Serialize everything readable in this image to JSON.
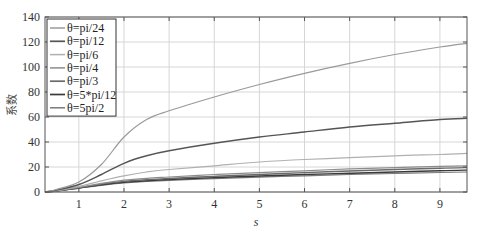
{
  "chart_data": {
    "type": "line",
    "title": "",
    "xlabel": "s",
    "ylabel": "系数",
    "xlim": [
      0.25,
      9.6
    ],
    "ylim": [
      0,
      140
    ],
    "xticks": [
      1,
      2,
      3,
      4,
      5,
      6,
      7,
      8,
      9
    ],
    "yticks": [
      0,
      20,
      40,
      60,
      80,
      100,
      120,
      140
    ],
    "grid": true,
    "legend_position": "upper-left",
    "x": [
      0.25,
      0.5,
      1.0,
      1.5,
      2.0,
      2.5,
      3.0,
      4.0,
      5.0,
      6.0,
      7.0,
      8.0,
      9.0,
      9.6
    ],
    "series": [
      {
        "name": "θ=pi/24",
        "color": "#9a9a9a",
        "width": 1.2,
        "values": [
          0,
          2,
          8,
          22,
          44,
          58,
          65,
          76,
          86,
          95,
          103,
          110,
          116,
          119
        ]
      },
      {
        "name": "θ=pi/12",
        "color": "#555555",
        "width": 1.4,
        "values": [
          0,
          1.5,
          6,
          14,
          23,
          29,
          33,
          39,
          44,
          48,
          52,
          55,
          58,
          59
        ]
      },
      {
        "name": "θ=pi/6",
        "color": "#b0b0b0",
        "width": 1.2,
        "values": [
          0,
          1,
          4.5,
          9,
          13,
          16,
          18,
          21,
          24,
          26,
          27.5,
          29,
          30,
          31
        ]
      },
      {
        "name": "θ=pi/4",
        "color": "#8c8c8c",
        "width": 1.2,
        "values": [
          0,
          1,
          3.8,
          7,
          9.5,
          11,
          12,
          14,
          15.5,
          17,
          18.5,
          19.5,
          20.5,
          21
        ]
      },
      {
        "name": "θ=pi/3",
        "color": "#6a6a6a",
        "width": 1.4,
        "values": [
          0,
          0.9,
          3.5,
          6.3,
          8.5,
          9.8,
          10.8,
          12.5,
          14,
          15.5,
          16.8,
          18,
          19,
          19.5
        ]
      },
      {
        "name": "θ=5*pi/12",
        "color": "#3a3a3a",
        "width": 1.4,
        "values": [
          0,
          0.8,
          3.2,
          5.8,
          7.8,
          9,
          10,
          11.5,
          12.8,
          14,
          15,
          16,
          17,
          17.5
        ]
      },
      {
        "name": "θ=5pi/2",
        "color": "#7a7a7a",
        "width": 1.2,
        "values": [
          0,
          0.8,
          3.0,
          5.4,
          7.2,
          8.4,
          9.3,
          10.7,
          11.9,
          13,
          14,
          14.8,
          15.6,
          16
        ]
      }
    ]
  },
  "legend": {
    "items": [
      "θ=pi/24",
      "θ=pi/12",
      "θ=pi/6",
      "θ=pi/4",
      "θ=pi/3",
      "θ=5*pi/12",
      "θ=5pi/2"
    ]
  },
  "axes": {
    "xlabel": "s",
    "ylabel": "系数",
    "xtick_labels": [
      "1",
      "2",
      "3",
      "4",
      "5",
      "6",
      "7",
      "8",
      "9"
    ],
    "ytick_labels": [
      "0",
      "20",
      "40",
      "60",
      "80",
      "100",
      "120",
      "140"
    ]
  }
}
